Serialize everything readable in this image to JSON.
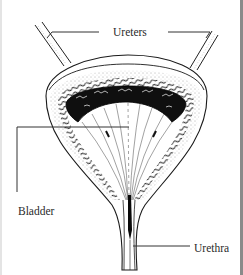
{
  "diagram": {
    "labels": {
      "ureters": "Ureters",
      "bladder": "Bladder",
      "urethra": "Urethra"
    },
    "colors": {
      "background": "#ffffff",
      "ink": "#1a1a1a",
      "leader_line": "#333333",
      "frame_right": "#8a8a8a"
    }
  }
}
